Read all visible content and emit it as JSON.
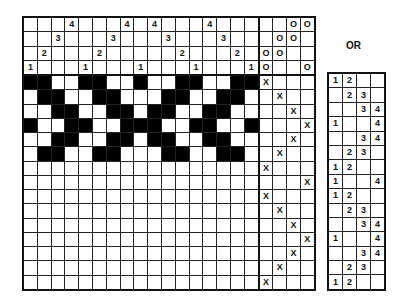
{
  "diagram": {
    "type": "weaving draft",
    "threading": {
      "shafts_top_to_bottom": [
        4,
        3,
        2,
        1
      ],
      "columns": [
        1,
        2,
        3,
        4,
        1,
        2,
        3,
        4,
        1,
        4,
        3,
        2,
        1,
        4,
        3,
        2,
        1
      ]
    },
    "tieup": {
      "rows_shafts_top_to_bottom": [
        4,
        3,
        2,
        1
      ],
      "marks": [
        [
          "",
          "",
          "O",
          "O"
        ],
        [
          "",
          "O",
          "O",
          ""
        ],
        [
          "O",
          "O",
          "",
          ""
        ],
        [
          "O",
          "",
          "",
          "O"
        ]
      ]
    },
    "treadling": [
      1,
      2,
      3,
      4,
      3,
      2,
      1,
      4,
      1,
      2,
      3,
      4,
      3,
      2,
      1
    ],
    "treadle_mark": "X",
    "drawdown_filled_rows": 6,
    "or_label": "OR",
    "liftplan": [
      [
        "1",
        "2",
        "",
        ""
      ],
      [
        "",
        "2",
        "3",
        ""
      ],
      [
        "",
        "",
        "3",
        "4"
      ],
      [
        "1",
        "",
        "",
        "4"
      ],
      [
        "",
        "",
        "3",
        "4"
      ],
      [
        "",
        "2",
        "3",
        ""
      ],
      [
        "1",
        "2",
        "",
        ""
      ],
      [
        "1",
        "",
        "",
        "4"
      ],
      [
        "1",
        "2",
        "",
        ""
      ],
      [
        "",
        "2",
        "3",
        ""
      ],
      [
        "",
        "",
        "3",
        "4"
      ],
      [
        "1",
        "",
        "",
        "4"
      ],
      [
        "",
        "",
        "3",
        "4"
      ],
      [
        "",
        "2",
        "3",
        ""
      ],
      [
        "1",
        "2",
        "",
        ""
      ]
    ],
    "colors": {
      "ink": "#000000",
      "paper": "#ffffff"
    }
  }
}
